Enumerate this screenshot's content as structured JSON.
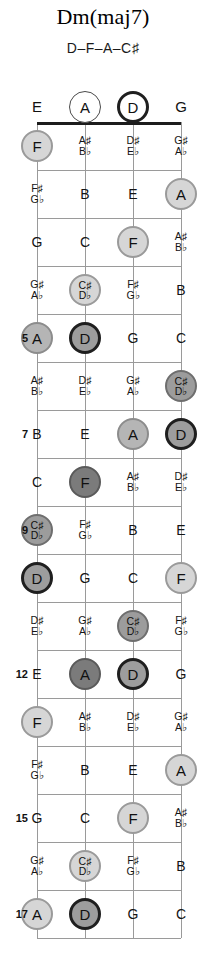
{
  "title": "Dm(maj7)",
  "notes_line": "D–F–A–C♯",
  "colors": {
    "root_fill": "#9d9d9d",
    "root_border": "#1f1f1f",
    "third_fill": "#7b7b7b",
    "fifth_fill": "#b5b5b5",
    "seventh_fill": "#9c9c9c",
    "light_fill": "#d6d6d6",
    "line": "#9a9a9a",
    "nut": "#1c1c1c",
    "text": "#111111"
  },
  "instrument": {
    "type": "bass-fretboard",
    "string_count": 4,
    "open_strings": [
      "E",
      "A",
      "D",
      "G"
    ],
    "fret_count": 17
  },
  "fret_numbers": [
    "5",
    "7",
    "9",
    "12",
    "15",
    "17"
  ],
  "open_row": [
    {
      "label": "E",
      "circled": false,
      "tone": "none"
    },
    {
      "label": "A",
      "circled": true,
      "tone": "open"
    },
    {
      "label": "D",
      "circled": true,
      "tone": "open-root"
    },
    {
      "label": "G",
      "circled": false,
      "tone": "none"
    }
  ],
  "frets": [
    {
      "number": 1,
      "show_number": false,
      "cells": [
        {
          "label": "F",
          "sharp": "",
          "flat": "",
          "circled": true,
          "tone": "light"
        },
        {
          "label": "",
          "sharp": "A♯",
          "flat": "B♭",
          "circled": false,
          "tone": "none"
        },
        {
          "label": "",
          "sharp": "D♯",
          "flat": "E♭",
          "circled": false,
          "tone": "none"
        },
        {
          "label": "",
          "sharp": "G♯",
          "flat": "A♭",
          "circled": false,
          "tone": "none"
        }
      ]
    },
    {
      "number": 2,
      "show_number": false,
      "cells": [
        {
          "label": "",
          "sharp": "F♯",
          "flat": "G♭",
          "circled": false,
          "tone": "none"
        },
        {
          "label": "B",
          "sharp": "",
          "flat": "",
          "circled": false,
          "tone": "none"
        },
        {
          "label": "E",
          "sharp": "",
          "flat": "",
          "circled": false,
          "tone": "none"
        },
        {
          "label": "A",
          "sharp": "",
          "flat": "",
          "circled": true,
          "tone": "light"
        }
      ]
    },
    {
      "number": 3,
      "show_number": false,
      "cells": [
        {
          "label": "G",
          "sharp": "",
          "flat": "",
          "circled": false,
          "tone": "none"
        },
        {
          "label": "C",
          "sharp": "",
          "flat": "",
          "circled": false,
          "tone": "none"
        },
        {
          "label": "F",
          "sharp": "",
          "flat": "",
          "circled": true,
          "tone": "light"
        },
        {
          "label": "",
          "sharp": "A♯",
          "flat": "B♭",
          "circled": false,
          "tone": "none"
        }
      ]
    },
    {
      "number": 4,
      "show_number": false,
      "cells": [
        {
          "label": "",
          "sharp": "G♯",
          "flat": "A♭",
          "circled": false,
          "tone": "none"
        },
        {
          "label": "",
          "sharp": "C♯",
          "flat": "D♭",
          "circled": true,
          "tone": "light"
        },
        {
          "label": "",
          "sharp": "F♯",
          "flat": "G♭",
          "circled": false,
          "tone": "none"
        },
        {
          "label": "B",
          "sharp": "",
          "flat": "",
          "circled": false,
          "tone": "none"
        }
      ]
    },
    {
      "number": 5,
      "show_number": true,
      "cells": [
        {
          "label": "A",
          "sharp": "",
          "flat": "",
          "circled": true,
          "tone": "fifth"
        },
        {
          "label": "D",
          "sharp": "",
          "flat": "",
          "circled": true,
          "tone": "root"
        },
        {
          "label": "G",
          "sharp": "",
          "flat": "",
          "circled": false,
          "tone": "none"
        },
        {
          "label": "C",
          "sharp": "",
          "flat": "",
          "circled": false,
          "tone": "none"
        }
      ]
    },
    {
      "number": 6,
      "show_number": false,
      "cells": [
        {
          "label": "",
          "sharp": "A♯",
          "flat": "B♭",
          "circled": false,
          "tone": "none"
        },
        {
          "label": "",
          "sharp": "D♯",
          "flat": "E♭",
          "circled": false,
          "tone": "none"
        },
        {
          "label": "",
          "sharp": "G♯",
          "flat": "A♭",
          "circled": false,
          "tone": "none"
        },
        {
          "label": "",
          "sharp": "C♯",
          "flat": "D♭",
          "circled": true,
          "tone": "seventh"
        }
      ]
    },
    {
      "number": 7,
      "show_number": true,
      "cells": [
        {
          "label": "B",
          "sharp": "",
          "flat": "",
          "circled": false,
          "tone": "none"
        },
        {
          "label": "E",
          "sharp": "",
          "flat": "",
          "circled": false,
          "tone": "none"
        },
        {
          "label": "A",
          "sharp": "",
          "flat": "",
          "circled": true,
          "tone": "fifth"
        },
        {
          "label": "D",
          "sharp": "",
          "flat": "",
          "circled": true,
          "tone": "root"
        }
      ]
    },
    {
      "number": 8,
      "show_number": false,
      "cells": [
        {
          "label": "C",
          "sharp": "",
          "flat": "",
          "circled": false,
          "tone": "none"
        },
        {
          "label": "F",
          "sharp": "",
          "flat": "",
          "circled": true,
          "tone": "third"
        },
        {
          "label": "",
          "sharp": "A♯",
          "flat": "B♭",
          "circled": false,
          "tone": "none"
        },
        {
          "label": "",
          "sharp": "D♯",
          "flat": "E♭",
          "circled": false,
          "tone": "none"
        }
      ]
    },
    {
      "number": 9,
      "show_number": true,
      "cells": [
        {
          "label": "",
          "sharp": "C♯",
          "flat": "D♭",
          "circled": true,
          "tone": "seventh"
        },
        {
          "label": "",
          "sharp": "F♯",
          "flat": "G♭",
          "circled": false,
          "tone": "none"
        },
        {
          "label": "B",
          "sharp": "",
          "flat": "",
          "circled": false,
          "tone": "none"
        },
        {
          "label": "E",
          "sharp": "",
          "flat": "",
          "circled": false,
          "tone": "none"
        }
      ]
    },
    {
      "number": 10,
      "show_number": false,
      "cells": [
        {
          "label": "D",
          "sharp": "",
          "flat": "",
          "circled": true,
          "tone": "root"
        },
        {
          "label": "G",
          "sharp": "",
          "flat": "",
          "circled": false,
          "tone": "none"
        },
        {
          "label": "C",
          "sharp": "",
          "flat": "",
          "circled": false,
          "tone": "none"
        },
        {
          "label": "F",
          "sharp": "",
          "flat": "",
          "circled": true,
          "tone": "light"
        }
      ]
    },
    {
      "number": 11,
      "show_number": false,
      "cells": [
        {
          "label": "",
          "sharp": "D♯",
          "flat": "E♭",
          "circled": false,
          "tone": "none"
        },
        {
          "label": "",
          "sharp": "G♯",
          "flat": "A♭",
          "circled": false,
          "tone": "none"
        },
        {
          "label": "",
          "sharp": "C♯",
          "flat": "D♭",
          "circled": true,
          "tone": "seventh"
        },
        {
          "label": "",
          "sharp": "F♯",
          "flat": "G♭",
          "circled": false,
          "tone": "none"
        }
      ]
    },
    {
      "number": 12,
      "show_number": true,
      "cells": [
        {
          "label": "E",
          "sharp": "",
          "flat": "",
          "circled": false,
          "tone": "none"
        },
        {
          "label": "A",
          "sharp": "",
          "flat": "",
          "circled": true,
          "tone": "third"
        },
        {
          "label": "D",
          "sharp": "",
          "flat": "",
          "circled": true,
          "tone": "root"
        },
        {
          "label": "G",
          "sharp": "",
          "flat": "",
          "circled": false,
          "tone": "none"
        }
      ]
    },
    {
      "number": 13,
      "show_number": false,
      "cells": [
        {
          "label": "F",
          "sharp": "",
          "flat": "",
          "circled": true,
          "tone": "light"
        },
        {
          "label": "",
          "sharp": "A♯",
          "flat": "B♭",
          "circled": false,
          "tone": "none"
        },
        {
          "label": "",
          "sharp": "D♯",
          "flat": "E♭",
          "circled": false,
          "tone": "none"
        },
        {
          "label": "",
          "sharp": "G♯",
          "flat": "A♭",
          "circled": false,
          "tone": "none"
        }
      ]
    },
    {
      "number": 14,
      "show_number": false,
      "cells": [
        {
          "label": "",
          "sharp": "F♯",
          "flat": "G♭",
          "circled": false,
          "tone": "none"
        },
        {
          "label": "B",
          "sharp": "",
          "flat": "",
          "circled": false,
          "tone": "none"
        },
        {
          "label": "E",
          "sharp": "",
          "flat": "",
          "circled": false,
          "tone": "none"
        },
        {
          "label": "A",
          "sharp": "",
          "flat": "",
          "circled": true,
          "tone": "light"
        }
      ]
    },
    {
      "number": 15,
      "show_number": true,
      "cells": [
        {
          "label": "G",
          "sharp": "",
          "flat": "",
          "circled": false,
          "tone": "none"
        },
        {
          "label": "C",
          "sharp": "",
          "flat": "",
          "circled": false,
          "tone": "none"
        },
        {
          "label": "F",
          "sharp": "",
          "flat": "",
          "circled": true,
          "tone": "light"
        },
        {
          "label": "",
          "sharp": "A♯",
          "flat": "B♭",
          "circled": false,
          "tone": "none"
        }
      ]
    },
    {
      "number": 16,
      "show_number": false,
      "cells": [
        {
          "label": "",
          "sharp": "G♯",
          "flat": "A♭",
          "circled": false,
          "tone": "none"
        },
        {
          "label": "",
          "sharp": "C♯",
          "flat": "D♭",
          "circled": true,
          "tone": "light"
        },
        {
          "label": "",
          "sharp": "F♯",
          "flat": "G♭",
          "circled": false,
          "tone": "none"
        },
        {
          "label": "B",
          "sharp": "",
          "flat": "",
          "circled": false,
          "tone": "none"
        }
      ]
    },
    {
      "number": 17,
      "show_number": true,
      "cells": [
        {
          "label": "A",
          "sharp": "",
          "flat": "",
          "circled": true,
          "tone": "light"
        },
        {
          "label": "D",
          "sharp": "",
          "flat": "",
          "circled": true,
          "tone": "root"
        },
        {
          "label": "G",
          "sharp": "",
          "flat": "",
          "circled": false,
          "tone": "none"
        },
        {
          "label": "C",
          "sharp": "",
          "flat": "",
          "circled": false,
          "tone": "none"
        }
      ]
    }
  ]
}
